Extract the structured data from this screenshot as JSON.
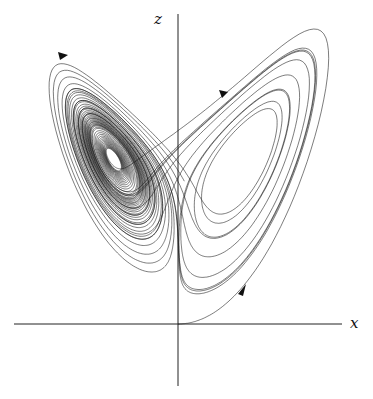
{
  "figure": {
    "axes": {
      "x_label": "x",
      "z_label": "z"
    },
    "colors": {
      "background": "#ffffff",
      "stroke": "#111111"
    },
    "features": {
      "left_lobe": "dense spiral with white elliptical hole",
      "right_lobe": "spiral around open elliptical hole",
      "arrows": 3
    }
  }
}
